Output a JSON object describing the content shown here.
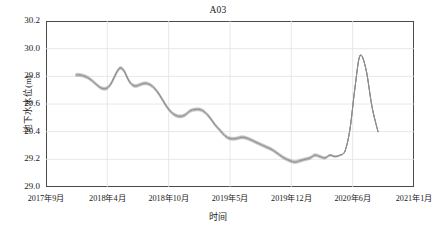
{
  "chart_data": {
    "type": "line",
    "title": "A03",
    "xlabel": "时间",
    "ylabel": "地下水水位(m)",
    "ylim": [
      29.0,
      30.2
    ],
    "yticks": [
      "29.0",
      "29.2",
      "29.4",
      "29.6",
      "29.8",
      "30.0",
      "30.2"
    ],
    "ytick_values": [
      29.0,
      29.2,
      29.4,
      29.6,
      29.8,
      30.0,
      30.2
    ],
    "xticks": [
      "2017年9月",
      "2018年4月",
      "2018年10月",
      "2019年5月",
      "2019年12月",
      "2020年6月",
      "2021年1月"
    ],
    "grid": true,
    "legend": "none",
    "line_color": "#8c8c8c",
    "band_note": "ensemble of closely spaced gray lines",
    "series": [
      {
        "name": "地下水水位",
        "x": [
          76,
          80,
          85,
          90,
          95,
          100,
          104,
          108,
          112,
          116,
          120,
          124,
          128,
          132,
          136,
          140,
          145,
          150,
          155,
          160,
          165,
          170,
          175,
          180,
          185,
          190,
          195,
          200,
          205,
          210,
          215,
          220,
          225,
          230,
          236,
          242,
          248,
          254,
          260,
          266,
          272,
          278,
          284,
          290,
          295,
          300,
          305,
          310,
          315,
          320,
          325,
          330,
          335,
          340,
          345,
          350,
          355,
          360,
          366,
          372,
          378
        ],
        "values": [
          29.81,
          29.81,
          29.8,
          29.78,
          29.75,
          29.72,
          29.71,
          29.72,
          29.76,
          29.82,
          29.86,
          29.84,
          29.78,
          29.74,
          29.73,
          29.74,
          29.75,
          29.74,
          29.71,
          29.66,
          29.6,
          29.55,
          29.52,
          29.51,
          29.52,
          29.55,
          29.56,
          29.56,
          29.54,
          29.5,
          29.45,
          29.41,
          29.37,
          29.35,
          29.35,
          29.36,
          29.35,
          29.33,
          29.31,
          29.29,
          29.27,
          29.24,
          29.21,
          29.19,
          29.18,
          29.19,
          29.2,
          29.21,
          29.23,
          29.22,
          29.21,
          29.23,
          29.22,
          29.23,
          29.26,
          29.42,
          29.72,
          29.95,
          29.85,
          29.58,
          29.4
        ]
      }
    ],
    "peak": {
      "value": 29.97,
      "label": "2020年7月"
    },
    "minimum": {
      "value": 29.18,
      "label": "2019年12月"
    }
  }
}
